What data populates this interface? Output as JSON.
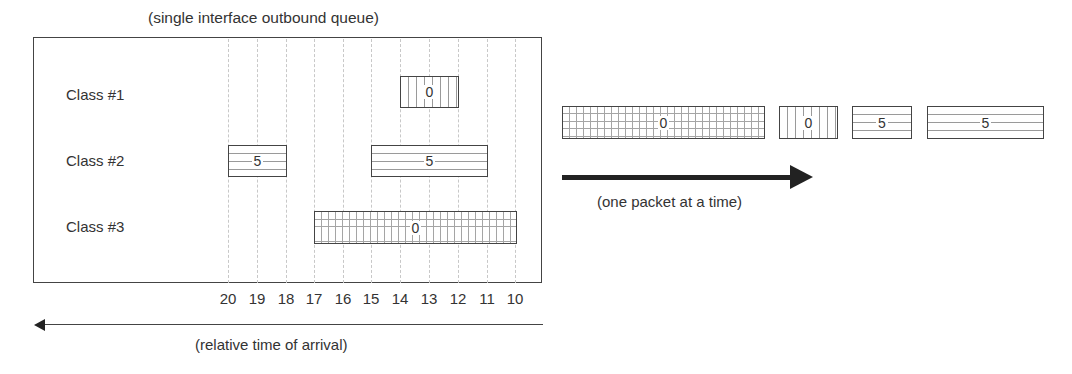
{
  "diagram": {
    "title": "(single interface outbound queue)",
    "classes": [
      {
        "label": "Class #1",
        "pattern": "vertical-lines"
      },
      {
        "label": "Class #2",
        "pattern": "horizontal-lines"
      },
      {
        "label": "Class #3",
        "pattern": "grid"
      }
    ],
    "queue_packets": [
      {
        "class": "Class #1",
        "value": "0",
        "start_tick": 14,
        "end_tick": 12
      },
      {
        "class": "Class #2",
        "value": "5",
        "start_tick": 20,
        "end_tick": 18
      },
      {
        "class": "Class #2",
        "value": "5",
        "start_tick": 15,
        "end_tick": 11
      },
      {
        "class": "Class #3",
        "value": "0",
        "start_tick": 17,
        "end_tick": 10
      }
    ],
    "time_axis": {
      "ticks": [
        "20",
        "19",
        "18",
        "17",
        "16",
        "15",
        "14",
        "13",
        "12",
        "11",
        "10"
      ],
      "label": "(relative time of arrival)",
      "direction": "left"
    },
    "output": {
      "packets": [
        {
          "class": "Class #3",
          "value": "0"
        },
        {
          "class": "Class #1",
          "value": "0"
        },
        {
          "class": "Class #2",
          "value": "5"
        },
        {
          "class": "Class #2",
          "value": "5"
        }
      ],
      "label": "(one packet at a time)",
      "direction": "right"
    },
    "colors": {
      "line": "#444444",
      "text": "#333333",
      "pattern": "#9a9a9a",
      "gridline": "#c8c8c8"
    }
  }
}
